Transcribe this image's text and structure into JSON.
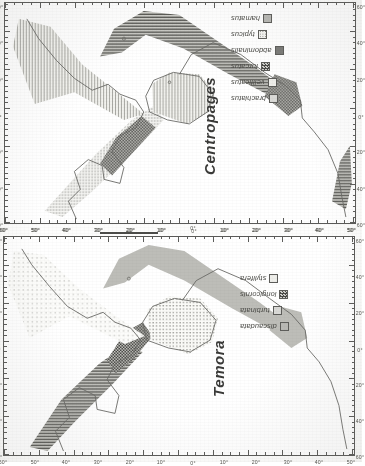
{
  "figure": {
    "kind": "two-panel distribution map figure",
    "orientation_note": "page content rotated 90 degrees counter-clockwise",
    "panels": [
      {
        "id": "centropages",
        "genus_label": "Centropages",
        "legend": {
          "items": [
            {
              "label": "brachiatus",
              "pattern": "p-solid-lt"
            },
            {
              "label": "velificatus",
              "pattern": "p-solid-xlt"
            },
            {
              "label": "furcatus",
              "pattern": "p-check-dk"
            },
            {
              "label": "abdominalis",
              "pattern": "p-solid-dk"
            },
            {
              "label": "typicus",
              "pattern": "p-dots"
            },
            {
              "label": "hamatus",
              "pattern": "p-solid-md"
            }
          ]
        },
        "axes": {
          "top_labels": [
            "60°",
            "40°",
            "20°",
            "0°",
            "20°",
            "40°",
            "60°"
          ],
          "bottom_labels": [
            "60°",
            "40°",
            "20°",
            "0°",
            "20°",
            "40°",
            "60°"
          ],
          "left_labels": [
            "60°",
            "50°",
            "40°",
            "30°",
            "20°",
            "10°",
            "0°",
            "10°",
            "20°",
            "30°",
            "40°",
            "50°"
          ],
          "right_labels": [
            "60°",
            "50°",
            "40°",
            "30°",
            "20°",
            "10°",
            "0°",
            "10°",
            "20°",
            "30°",
            "40°",
            "50°"
          ]
        }
      },
      {
        "id": "temora",
        "genus_label": "Temora",
        "legend": {
          "items": [
            {
              "label": "discaudata",
              "pattern": "p-solid-md"
            },
            {
              "label": "turbinata",
              "pattern": "p-solid-lt"
            },
            {
              "label": "longicornis",
              "pattern": "p-check-dk"
            },
            {
              "label": "stylifera",
              "pattern": "p-solid-xlt"
            }
          ]
        },
        "axes": {
          "top_labels": [
            "60°",
            "40°",
            "20°",
            "0°",
            "20°",
            "40°",
            "60°"
          ],
          "bottom_labels": [
            "60°",
            "40°",
            "20°",
            "0°",
            "20°",
            "40°",
            "60°"
          ],
          "left_labels": [
            "60°",
            "50°",
            "40°",
            "30°",
            "20°",
            "10°",
            "0°",
            "10°",
            "20°",
            "30°",
            "40°",
            "50°"
          ],
          "right_labels": [
            "60°",
            "50°",
            "40°",
            "30°",
            "20°",
            "10°",
            "0°",
            "10°",
            "20°",
            "30°",
            "40°",
            "50°"
          ]
        }
      }
    ],
    "colors": {
      "ink": "#4a4a46",
      "frame": "#5a5a58",
      "paper": "#fdfdfc"
    }
  }
}
